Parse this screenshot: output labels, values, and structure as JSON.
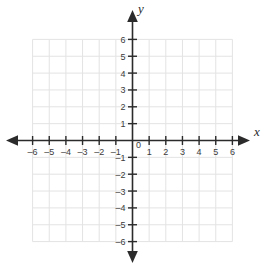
{
  "figure": {
    "title": "",
    "background_color": "#ffffff",
    "grid_color": "#e3e3e3",
    "axis_color": "#2b2b2b",
    "label_color": "#3b3b3b"
  },
  "axes": {
    "x_label": "x",
    "y_label": "y",
    "origin_label": "0",
    "x_min": -6,
    "x_max": 6,
    "y_min": -6,
    "y_max": 6,
    "x_tick_labels": [
      "–6",
      "–5",
      "–4",
      "–3",
      "–2",
      "–1",
      "1",
      "2",
      "3",
      "4",
      "5",
      "6"
    ],
    "y_tick_labels": [
      "6",
      "5",
      "4",
      "3",
      "2",
      "1",
      "–1",
      "–2",
      "–3",
      "–4",
      "–5",
      "–6"
    ],
    "arrowheads": [
      "left",
      "right",
      "up",
      "down"
    ]
  },
  "chart_data": {
    "type": "scatter",
    "title": "",
    "xlabel": "x",
    "ylabel": "y",
    "xlim": [
      -6,
      6
    ],
    "ylim": [
      -6,
      6
    ],
    "x_ticks": [
      -6,
      -5,
      -4,
      -3,
      -2,
      -1,
      0,
      1,
      2,
      3,
      4,
      5,
      6
    ],
    "y_ticks": [
      -6,
      -5,
      -4,
      -3,
      -2,
      -1,
      0,
      1,
      2,
      3,
      4,
      5,
      6
    ],
    "x_tick_labels": [
      "–6",
      "–5",
      "–4",
      "–3",
      "–2",
      "–1",
      "0",
      "1",
      "2",
      "3",
      "4",
      "5",
      "6"
    ],
    "y_tick_labels": [
      "–6",
      "–5",
      "–4",
      "–3",
      "–2",
      "–1",
      "0",
      "1",
      "2",
      "3",
      "4",
      "5",
      "6"
    ],
    "grid": true,
    "legend": null,
    "series": [],
    "x": [],
    "values": [],
    "annotations": []
  }
}
